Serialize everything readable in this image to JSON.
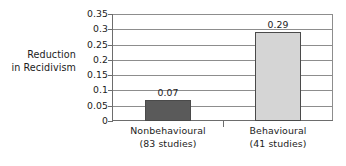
{
  "chart_data": {
    "type": "bar",
    "title": "",
    "xlabel": "",
    "ylabel": "Reduction in Recidivism",
    "ylabel_lines": [
      "Reduction",
      "in Recidivism"
    ],
    "categories": [
      "Nonbehavioural",
      "Behavioural"
    ],
    "category_sublabels": [
      "(83 studies)",
      "(41 studies)"
    ],
    "values": [
      0.07,
      0.29
    ],
    "value_labels": [
      "0.07",
      "0.29"
    ],
    "ylim": [
      0,
      0.35
    ],
    "ytick_values": [
      0,
      0.05,
      0.1,
      0.15,
      0.2,
      0.25,
      0.3,
      0.35
    ],
    "ytick_labels": [
      "0",
      "0.05",
      "0.1",
      "0.15",
      "0.2",
      "0.25",
      "0.3",
      "0.35"
    ],
    "grid": true,
    "grid_axis": "y",
    "legend": false,
    "legend_position": "none",
    "bar_colors": [
      "#5a5a5a",
      "#d5d5d5"
    ],
    "bar_border_color": "#4a4a4a",
    "gridline_color": "#8d8d8d",
    "axis_color": "#6d6d6d",
    "background_color": "#ffffff",
    "text_color": "#1c1c1c"
  }
}
